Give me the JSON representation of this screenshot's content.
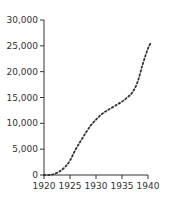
{
  "chart_data": {
    "type": "line",
    "title": "",
    "xlabel": "",
    "ylabel": "",
    "x": [
      1920,
      1921,
      1922,
      1923,
      1924,
      1925,
      1926,
      1927,
      1928,
      1929,
      1930,
      1931,
      1932,
      1933,
      1934,
      1935,
      1936,
      1937,
      1938,
      1939,
      1940,
      1940.5
    ],
    "series": [
      {
        "name": "series-1",
        "values": [
          0,
          0,
          200,
          700,
          1500,
          2800,
          4800,
          6500,
          8100,
          9600,
          10700,
          11700,
          12400,
          13000,
          13600,
          14200,
          15000,
          16000,
          18000,
          21500,
          24500,
          25500
        ]
      }
    ],
    "xticks": [
      1920,
      1925,
      1930,
      1935,
      1940
    ],
    "yticks": [
      0,
      5000,
      10000,
      15000,
      20000,
      25000,
      30000
    ],
    "xtick_labels": [
      "1920",
      "1925",
      "1930",
      "1935",
      "1940"
    ],
    "ytick_labels": [
      "0",
      "5,000",
      "10,000",
      "15,000",
      "20,000",
      "25,000",
      "30,000"
    ],
    "xlim": [
      1920,
      1940
    ],
    "ylim": [
      0,
      30000
    ],
    "grid": false,
    "legend": "none",
    "line_style": "dotted",
    "line_color": "#333333"
  }
}
